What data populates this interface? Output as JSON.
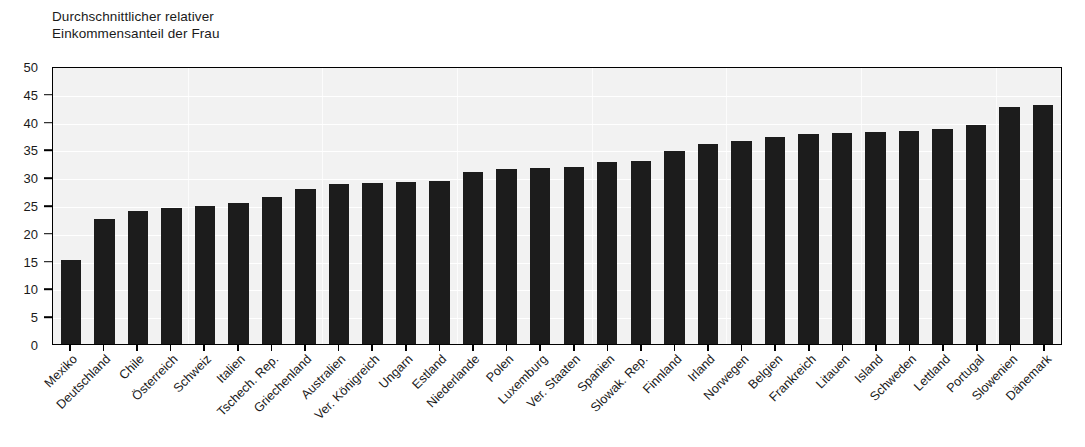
{
  "chart_data": {
    "type": "bar",
    "title": "Durchschnittlicher relativer Einkommensanteil der Frau",
    "title_lines": [
      "Durchschnittlicher relativer",
      "Einkommensanteil der Frau"
    ],
    "xlabel": "",
    "ylabel": "",
    "ylim": [
      0,
      50
    ],
    "yticks": [
      0,
      5,
      10,
      15,
      20,
      25,
      30,
      35,
      40,
      45,
      50
    ],
    "ytick_labels": [
      "0",
      "5",
      "10",
      "15",
      "20",
      "25",
      "30",
      "35",
      "40",
      "45",
      "50"
    ],
    "grid": true,
    "legend": "none",
    "bar_color": "#1c1c1c",
    "plot_background": "#f2f2f2",
    "gridline_color": "#ffffff",
    "categories": [
      "Mexiko",
      "Deutschland",
      "Chile",
      "Österreich",
      "Schweiz",
      "Italien",
      "Tschech. Rep.",
      "Griechenland",
      "Australien",
      "Ver. Königreich",
      "Ungarn",
      "Estland",
      "Niederlande",
      "Polen",
      "Luxemburg",
      "Ver. Staaten",
      "Spanien",
      "Slowak. Rep.",
      "Finnland",
      "Irland",
      "Norwegen",
      "Belgien",
      "Frankreich",
      "Litauen",
      "Island",
      "Schweden",
      "Lettland",
      "Portugal",
      "Slowenien",
      "Dänemark"
    ],
    "values": [
      15.1,
      22.5,
      23.9,
      24.5,
      24.9,
      25.4,
      26.4,
      27.8,
      28.7,
      29.0,
      29.1,
      29.4,
      31.0,
      31.4,
      31.7,
      31.9,
      32.7,
      32.9,
      34.7,
      36.0,
      36.6,
      37.3,
      37.8,
      38.0,
      38.2,
      38.4,
      38.7,
      39.4,
      42.7,
      42.9
    ]
  }
}
